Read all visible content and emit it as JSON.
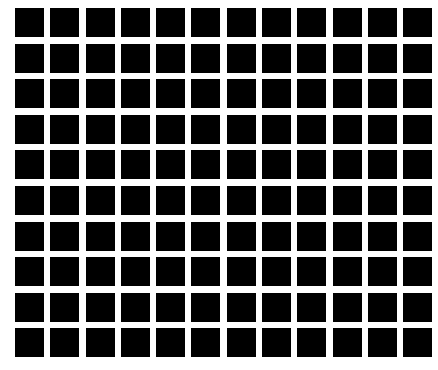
{
  "figure": {
    "name": "hermann-grid",
    "type": "illusion-grid",
    "canvas": {
      "width": 438,
      "height": 370,
      "background_color": "#ffffff"
    },
    "grid": {
      "columns": 12,
      "rows": 10,
      "tile_count": 120,
      "tile_color": "#000000",
      "gutter_color": "#ffffff",
      "tile_width": 29,
      "tile_height": 29,
      "gap_x": 6.3,
      "gap_y": 6.6,
      "pitch_x": 35.5,
      "pitch_y": 35.6,
      "offset_left": 15,
      "offset_top": 8,
      "grid_width": 410,
      "grid_height": 354,
      "has_intersection_dots": false
    }
  }
}
